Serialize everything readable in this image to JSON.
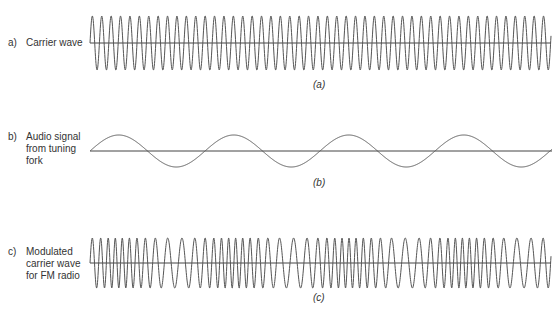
{
  "panels": [
    {
      "key": "a)",
      "label": "Carrier wave",
      "caption": "(a)",
      "type": "carrier",
      "x_start": 90,
      "x_end": 551,
      "baseline_y": 43,
      "amplitude": 27,
      "period_px": 9.4
    },
    {
      "key": "b)",
      "label": "Audio signal\nfrom tuning\nfork",
      "caption": "(b)",
      "type": "audio",
      "x_start": 90,
      "x_end": 552,
      "baseline_y": 151,
      "amplitude": 16,
      "period_px": 115
    },
    {
      "key": "c)",
      "label": "Modulated\ncarrier wave\nfor FM radio",
      "caption": "(c)",
      "type": "fm",
      "x_start": 90,
      "x_end": 551,
      "baseline_y": 263,
      "amplitude": 25,
      "period_px": 9.4,
      "audio_period_px": 115,
      "deviation": 0.35
    }
  ],
  "colors": {
    "wave": "#555555",
    "axis": "#444444"
  }
}
